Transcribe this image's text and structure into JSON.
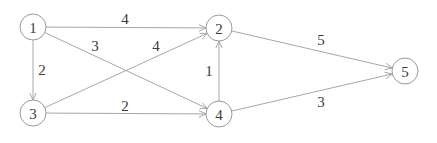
{
  "graph": {
    "type": "directed-weighted",
    "nodes": [
      {
        "id": "1",
        "label": "1"
      },
      {
        "id": "2",
        "label": "2"
      },
      {
        "id": "3",
        "label": "3"
      },
      {
        "id": "4",
        "label": "4"
      },
      {
        "id": "5",
        "label": "5"
      }
    ],
    "edges": [
      {
        "from": "1",
        "to": "2",
        "weight": "4"
      },
      {
        "from": "1",
        "to": "3",
        "weight": "2"
      },
      {
        "from": "1",
        "to": "4",
        "weight": "3"
      },
      {
        "from": "3",
        "to": "2",
        "weight": "4"
      },
      {
        "from": "3",
        "to": "4",
        "weight": "2"
      },
      {
        "from": "4",
        "to": "2",
        "weight": "1"
      },
      {
        "from": "2",
        "to": "5",
        "weight": "5"
      },
      {
        "from": "4",
        "to": "5",
        "weight": "3"
      }
    ]
  }
}
